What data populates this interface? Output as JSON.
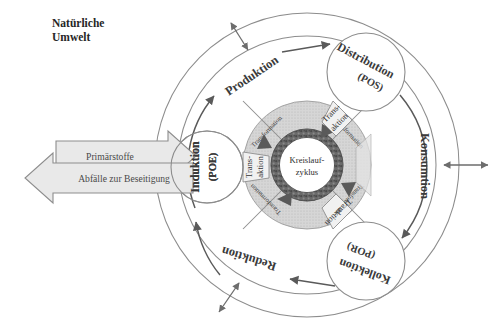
{
  "diagram": {
    "center": {
      "line1": "Kreislauf-",
      "line2": "zyklus"
    },
    "input_arrow": {
      "label": "Primärstoffe"
    },
    "output_arrow": {
      "label": "Abfälle zur Beseitigung"
    },
    "nodes": [
      {
        "id": "induktion",
        "name": "Induktion",
        "code": "(POE)"
      },
      {
        "id": "distribution",
        "name": "Distribution",
        "code": "(POS)"
      },
      {
        "id": "kollektion",
        "name": "Kollektion",
        "code": "(POR)"
      }
    ],
    "flows": [
      {
        "id": "produktion",
        "label": "Produktion"
      },
      {
        "id": "konsumtion",
        "label": "Konsumtion"
      },
      {
        "id": "reduktion",
        "label": "Reduktion"
      }
    ],
    "transformations": [
      {
        "id": "transformation-1",
        "label": "Transformation"
      },
      {
        "id": "transformation-2",
        "label": "Transformation"
      },
      {
        "id": "transformation-3",
        "label": "Transformation"
      },
      {
        "id": "transformation-4",
        "label": "Transformation"
      }
    ],
    "transactions": [
      {
        "id": "transaktion-left",
        "line1": "Trans-",
        "line2": "aktion"
      },
      {
        "id": "transaktion-top",
        "line1": "Trans-",
        "line2": "aktion"
      },
      {
        "id": "transaktion-right",
        "line1": "Trans-",
        "line2": "aktion"
      },
      {
        "id": "transaktion-bottom",
        "line1": "Trans-",
        "line2": "aktion"
      }
    ],
    "exchange_arrows": [
      {
        "id": "exchange-top-left"
      },
      {
        "id": "exchange-right"
      },
      {
        "id": "exchange-bottom-left"
      }
    ],
    "colors": {
      "ink": "#3a3a3a",
      "outline": "#8d8d8d",
      "ring_fill": "#d2d2d2",
      "core_ring": "#5e5e5e",
      "box_fill": "#e8e8e8",
      "arrow_fill": "#dcdcdc"
    }
  }
}
